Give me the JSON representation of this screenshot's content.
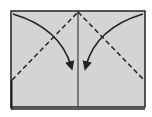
{
  "diagram": {
    "type": "origami-fold-instruction",
    "paper": {
      "fill": "#d4d4d4",
      "stroke": "#222222",
      "x": 11,
      "y": 11,
      "width": 134,
      "height": 96
    },
    "bottom_edge": {
      "y": 109,
      "stroke": "#222222"
    },
    "center_crease": {
      "x": 78,
      "style": "solid"
    },
    "valley_folds": [
      {
        "name": "left-valley-fold",
        "from": [
          11,
          80
        ],
        "to": [
          78,
          12
        ],
        "style": "dashed"
      },
      {
        "name": "right-valley-fold",
        "from": [
          78,
          12
        ],
        "to": [
          144,
          80
        ],
        "style": "dashed"
      }
    ],
    "fold_arrows": [
      {
        "name": "left-fold-arrow",
        "direction": "down-right",
        "start": [
          13,
          14
        ],
        "end": [
          72,
          68
        ]
      },
      {
        "name": "right-fold-arrow",
        "direction": "down-left",
        "start": [
          143,
          14
        ],
        "end": [
          85,
          68
        ]
      }
    ],
    "colors": {
      "paper": "#d4d4d4",
      "line": "#222222",
      "background": "#ffffff"
    }
  }
}
